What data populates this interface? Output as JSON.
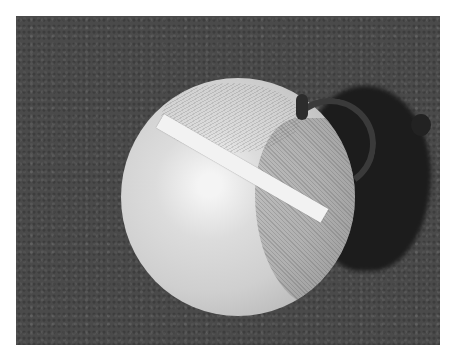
{
  "image": {
    "description": "Black-and-white photograph of a terrestrial globe lying on asphalt with a white strip of tape across it and a dark shadow to the right",
    "subjects": [
      "globe",
      "white tape strip",
      "meridian ring",
      "asphalt ground",
      "shadow"
    ],
    "colors": {
      "background": "#ffffff",
      "asphalt": "#4a4a4a",
      "shadow": "#1c1c1c",
      "globe": "#cfcfcf",
      "tape": "#f2f2f2"
    }
  }
}
